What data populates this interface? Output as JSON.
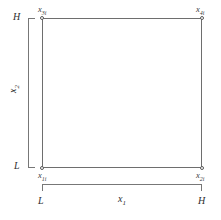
{
  "figure": {
    "type": "domain-diagram",
    "background_color": "#ffffff",
    "line_color": "#6e6e6e",
    "bracket_color": "#777777",
    "text_color": "#2e2e2e"
  },
  "chart_data": {
    "type": "scatter",
    "title": "",
    "xlabel": "x_1",
    "ylabel": "x_2",
    "xlim": [
      0,
      1
    ],
    "ylim": [
      0,
      1
    ],
    "grid": false,
    "legend": null,
    "x_tick_labels": [
      "L",
      "H"
    ],
    "y_tick_labels": [
      "L",
      "H"
    ],
    "points": [
      {
        "name": "x_1i",
        "x": 0,
        "y": 0,
        "label": "x",
        "subscript": "1i",
        "corner": "bottom-left"
      },
      {
        "name": "x_2i",
        "x": 1,
        "y": 0,
        "label": "x",
        "subscript": "2i",
        "corner": "bottom-right"
      },
      {
        "name": "x_3i",
        "x": 0,
        "y": 1,
        "label": "x",
        "subscript": "3i",
        "corner": "top-left"
      },
      {
        "name": "x_4i",
        "x": 1,
        "y": 1,
        "label": "x",
        "subscript": "4i",
        "corner": "top-right"
      }
    ],
    "edges": [
      [
        "x_1i",
        "x_2i"
      ],
      [
        "x_2i",
        "x_4i"
      ],
      [
        "x_4i",
        "x_3i"
      ],
      [
        "x_3i",
        "x_1i"
      ]
    ]
  },
  "vertices": {
    "top_left": {
      "base": "x",
      "sub": "3i"
    },
    "top_right": {
      "base": "x",
      "sub": "4i"
    },
    "bottom_left": {
      "base": "x",
      "sub": "1i"
    },
    "bottom_right": {
      "base": "x",
      "sub": "2i"
    }
  },
  "vertical_axis": {
    "title_base": "x",
    "title_sub": "2",
    "high_label": "H",
    "low_label": "L"
  },
  "horizontal_axis": {
    "title_base": "x",
    "title_sub": "1",
    "low_label": "L",
    "high_label": "H"
  }
}
